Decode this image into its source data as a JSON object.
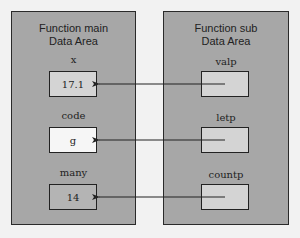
{
  "main": {
    "title_line1": "Function main",
    "title_line2": "Data Area",
    "vars": [
      {
        "name": "x",
        "value": "17.1"
      },
      {
        "name": "code",
        "value": "g"
      },
      {
        "name": "many",
        "value": "14"
      }
    ]
  },
  "sub": {
    "title_line1": "Function sub",
    "title_line2": "Data Area",
    "params": [
      {
        "name": "valp",
        "value": ""
      },
      {
        "name": "letp",
        "value": ""
      },
      {
        "name": "countp",
        "value": ""
      }
    ]
  },
  "colors": {
    "panel_fill": "#a7a7a7",
    "cell_fill": "#d4d4d4",
    "cell_highlight": "#f6f6f6",
    "line": "#222222"
  }
}
